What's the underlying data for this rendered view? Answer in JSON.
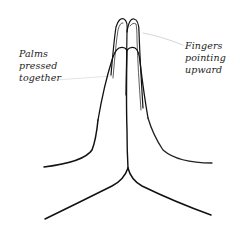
{
  "figure": {
    "colors": {
      "background": "#ffffff",
      "ink": "#111111",
      "pointer": "#cccccc"
    }
  },
  "labels": {
    "left": {
      "lines": [
        "Palms",
        "pressed",
        "together"
      ]
    },
    "right": {
      "lines": [
        "Fingers",
        "pointing",
        "upward"
      ]
    }
  }
}
